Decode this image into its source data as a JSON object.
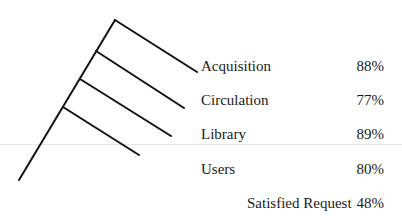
{
  "diagram": {
    "type": "tree",
    "branches": [
      {
        "label": "Acquisition",
        "value": "88%"
      },
      {
        "label": "Circulation",
        "value": "77%"
      },
      {
        "label": "Library",
        "value": "89%"
      },
      {
        "label": "Users",
        "value": "80%"
      }
    ],
    "root": {
      "label": "Satisfied Request",
      "value": "48%"
    }
  }
}
